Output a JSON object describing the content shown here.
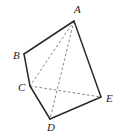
{
  "figure": {
    "kind": "geometry-diagram",
    "canvas": {
      "width": 121,
      "height": 137,
      "background": "#ffffff"
    },
    "style": {
      "solid_edge_color": "#2b2b2b",
      "dashed_edge_color": "#777777",
      "label_color": "#1d1d1d",
      "solid_edge_width": 1.5,
      "dashed_edge_width": 0.9
    },
    "vertices": [
      {
        "id": "A",
        "label": "A",
        "x": 74,
        "y": 21,
        "label_x": 74,
        "label_y": 4,
        "label_anchor": "above"
      },
      {
        "id": "B",
        "label": "B",
        "x": 24,
        "y": 54,
        "label_x": 13,
        "label_y": 50,
        "label_anchor": "left"
      },
      {
        "id": "C",
        "label": "C",
        "x": 30,
        "y": 86,
        "label_x": 18,
        "label_y": 82,
        "label_anchor": "left"
      },
      {
        "id": "D",
        "label": "D",
        "x": 50,
        "y": 119,
        "label_x": 47,
        "label_y": 122,
        "label_anchor": "below"
      },
      {
        "id": "E",
        "label": "E",
        "x": 101,
        "y": 97,
        "label_x": 106,
        "label_y": 93,
        "label_anchor": "right"
      }
    ],
    "edges_solid": [
      {
        "id": "AB",
        "from": "A",
        "to": "B",
        "path": "M 74 21 L 24 54"
      },
      {
        "id": "BC",
        "from": "B",
        "to": "C",
        "path": "M 24 54 L 30 86"
      },
      {
        "id": "CD",
        "from": "C",
        "to": "D",
        "path": "M 30 86 L 50 119"
      },
      {
        "id": "DE",
        "from": "D",
        "to": "E",
        "path": "M 50 119 L 101 97"
      },
      {
        "id": "EA",
        "from": "E",
        "to": "A",
        "path": "M 101 97 L 74 21"
      }
    ],
    "edges_dashed": [
      {
        "id": "AC",
        "from": "A",
        "to": "C",
        "path": "M 74 21 L 30 86"
      },
      {
        "id": "AD",
        "from": "A",
        "to": "D",
        "path": "M 74 21 L 50 119"
      },
      {
        "id": "CE",
        "from": "C",
        "to": "E",
        "path": "M 30 86 L 101 97"
      }
    ]
  }
}
